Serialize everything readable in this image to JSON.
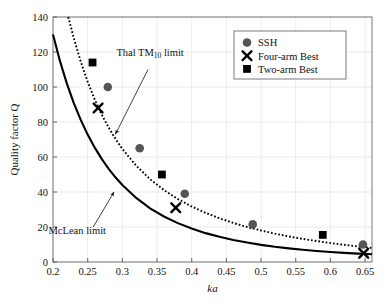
{
  "chart_data": {
    "type": "scatter",
    "title": "",
    "xlabel": "ka",
    "ylabel": "Quality factor Q",
    "xlim": [
      0.2,
      0.66
    ],
    "ylim": [
      0,
      140
    ],
    "xticks": [
      "0.2",
      "0.25",
      "0.3",
      "0.35",
      "0.4",
      "0.45",
      "0.5",
      "0.55",
      "0.6",
      "0.65"
    ],
    "xtick_values": [
      0.2,
      0.25,
      0.3,
      0.35,
      0.4,
      0.45,
      0.5,
      0.55,
      0.6,
      0.65
    ],
    "yticks": [
      "0",
      "20",
      "40",
      "60",
      "80",
      "100",
      "120",
      "140"
    ],
    "ytick_values": [
      0,
      20,
      40,
      60,
      80,
      100,
      120,
      140
    ],
    "grid": true,
    "legend_position": "top-right",
    "series": [
      {
        "name": "SSH",
        "marker": "circle",
        "color": "#555555",
        "points": [
          {
            "x": 0.279,
            "y": 100
          },
          {
            "x": 0.325,
            "y": 65
          },
          {
            "x": 0.39,
            "y": 39
          },
          {
            "x": 0.488,
            "y": 21.5
          },
          {
            "x": 0.647,
            "y": 10
          }
        ]
      },
      {
        "name": "Four-arm Best",
        "marker": "x",
        "color": "#000000",
        "points": [
          {
            "x": 0.265,
            "y": 88
          },
          {
            "x": 0.377,
            "y": 31
          },
          {
            "x": 0.648,
            "y": 5
          }
        ]
      },
      {
        "name": "Two-arm Best",
        "marker": "square",
        "color": "#000000",
        "points": [
          {
            "x": 0.257,
            "y": 114
          },
          {
            "x": 0.357,
            "y": 50
          },
          {
            "x": 0.589,
            "y": 15.5
          }
        ]
      }
    ],
    "curves": [
      {
        "name": "McLean limit",
        "style": "solid",
        "color": "#000000",
        "points": [
          {
            "x": 0.2,
            "y": 130.0
          },
          {
            "x": 0.21,
            "y": 114.9
          },
          {
            "x": 0.22,
            "y": 101.9
          },
          {
            "x": 0.23,
            "y": 90.8
          },
          {
            "x": 0.24,
            "y": 81.2
          },
          {
            "x": 0.25,
            "y": 72.8
          },
          {
            "x": 0.26,
            "y": 65.5
          },
          {
            "x": 0.27,
            "y": 59.1
          },
          {
            "x": 0.28,
            "y": 53.4
          },
          {
            "x": 0.29,
            "y": 48.4
          },
          {
            "x": 0.3,
            "y": 44.0
          },
          {
            "x": 0.32,
            "y": 36.6
          },
          {
            "x": 0.34,
            "y": 30.7
          },
          {
            "x": 0.36,
            "y": 26.0
          },
          {
            "x": 0.38,
            "y": 22.2
          },
          {
            "x": 0.4,
            "y": 19.1
          },
          {
            "x": 0.42,
            "y": 16.5
          },
          {
            "x": 0.44,
            "y": 14.4
          },
          {
            "x": 0.46,
            "y": 12.6
          },
          {
            "x": 0.48,
            "y": 11.1
          },
          {
            "x": 0.5,
            "y": 9.8
          },
          {
            "x": 0.52,
            "y": 8.7
          },
          {
            "x": 0.54,
            "y": 7.8
          },
          {
            "x": 0.56,
            "y": 7.0
          },
          {
            "x": 0.58,
            "y": 6.3
          },
          {
            "x": 0.6,
            "y": 5.7
          },
          {
            "x": 0.62,
            "y": 5.2
          },
          {
            "x": 0.64,
            "y": 4.8
          },
          {
            "x": 0.66,
            "y": 4.4
          }
        ]
      },
      {
        "name": "Thal TM10 limit",
        "style": "dotted",
        "color": "#000000",
        "points": [
          {
            "x": 0.222,
            "y": 140.0
          },
          {
            "x": 0.23,
            "y": 128.0
          },
          {
            "x": 0.24,
            "y": 114.5
          },
          {
            "x": 0.25,
            "y": 103.0
          },
          {
            "x": 0.26,
            "y": 93.0
          },
          {
            "x": 0.27,
            "y": 84.4
          },
          {
            "x": 0.28,
            "y": 77.0
          },
          {
            "x": 0.29,
            "y": 70.4
          },
          {
            "x": 0.3,
            "y": 64.6
          },
          {
            "x": 0.32,
            "y": 55.0
          },
          {
            "x": 0.34,
            "y": 47.3
          },
          {
            "x": 0.36,
            "y": 41.1
          },
          {
            "x": 0.38,
            "y": 36.0
          },
          {
            "x": 0.4,
            "y": 31.7
          },
          {
            "x": 0.42,
            "y": 28.1
          },
          {
            "x": 0.44,
            "y": 25.0
          },
          {
            "x": 0.46,
            "y": 22.3
          },
          {
            "x": 0.48,
            "y": 20.0
          },
          {
            "x": 0.5,
            "y": 18.0
          },
          {
            "x": 0.52,
            "y": 16.2
          },
          {
            "x": 0.54,
            "y": 14.6
          },
          {
            "x": 0.56,
            "y": 13.2
          },
          {
            "x": 0.58,
            "y": 12.0
          },
          {
            "x": 0.6,
            "y": 10.8
          },
          {
            "x": 0.62,
            "y": 9.8
          },
          {
            "x": 0.64,
            "y": 8.9
          },
          {
            "x": 0.66,
            "y": 8.0
          }
        ]
      }
    ],
    "annotations": [
      {
        "text": "Thal TM",
        "subscript": "10",
        "text_after": " limit",
        "label_x": 0.34,
        "label_y": 118,
        "arrow_from_x": 0.337,
        "arrow_from_y": 110,
        "arrow_to_x": 0.29,
        "arrow_to_y": 73
      },
      {
        "text": "McLean limit",
        "subscript": "",
        "text_after": "",
        "label_x": 0.235,
        "label_y": 16,
        "arrow_from_x": 0.258,
        "arrow_from_y": 20,
        "arrow_to_x": 0.288,
        "arrow_to_y": 40
      }
    ]
  },
  "legend": {
    "items": [
      {
        "label": "SSH",
        "marker": "circle"
      },
      {
        "label": "Four-arm Best",
        "marker": "x"
      },
      {
        "label": "Two-arm Best",
        "marker": "square"
      }
    ]
  }
}
